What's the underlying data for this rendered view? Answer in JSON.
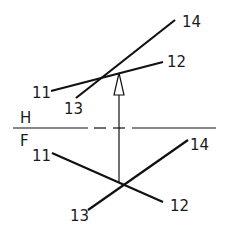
{
  "diagram": {
    "type": "orthographic-projection",
    "colors": {
      "line": "#111111",
      "background": "#ffffff"
    },
    "fold_line": {
      "upper_label": "H",
      "lower_label": "F"
    },
    "top_view": {
      "labels": {
        "p11": "11",
        "p12": "12",
        "p13": "13",
        "p14": "14"
      }
    },
    "front_view": {
      "labels": {
        "p11": "11",
        "p12": "12",
        "p13": "13",
        "p14": "14"
      }
    },
    "projector": {
      "description": "projection arrow from front view intersection to top view line 11-12"
    }
  }
}
